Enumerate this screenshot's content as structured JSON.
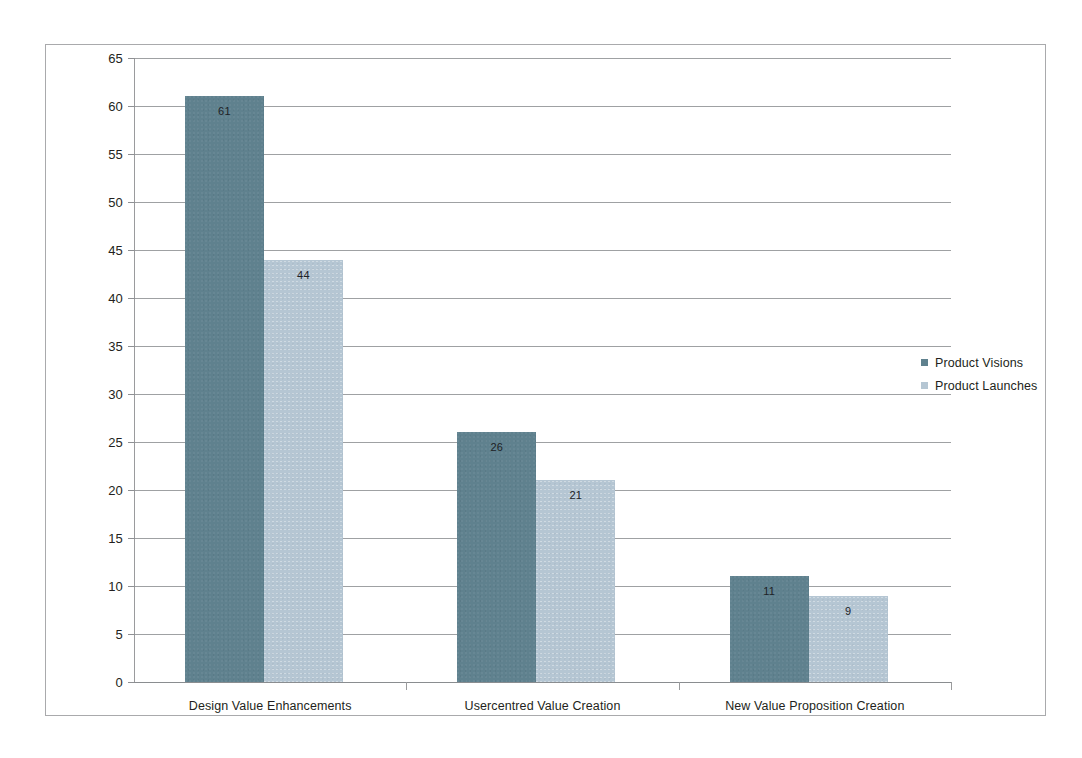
{
  "chart_data": {
    "type": "bar",
    "title": "",
    "xlabel": "",
    "ylabel": "",
    "categories": [
      "Design Value Enhancements",
      "Usercentred Value Creation",
      "New Value Proposition Creation"
    ],
    "series": [
      {
        "name": "Product Visions",
        "color": "#5f818e",
        "values": [
          61,
          26,
          11
        ]
      },
      {
        "name": "Product Launches",
        "color": "#b5c6d3",
        "values": [
          44,
          21,
          9
        ]
      }
    ],
    "ylim": [
      0,
      65
    ],
    "ytick_step": 5,
    "ytick_labels": [
      "0",
      "5",
      "10",
      "15",
      "20",
      "25",
      "30",
      "35",
      "40",
      "45",
      "50",
      "55",
      "60",
      "65"
    ],
    "grid": true,
    "grid_axis": "y",
    "legend_position": "right"
  },
  "frame": {
    "border_color": "#a9aaac",
    "background": "#ffffff"
  }
}
